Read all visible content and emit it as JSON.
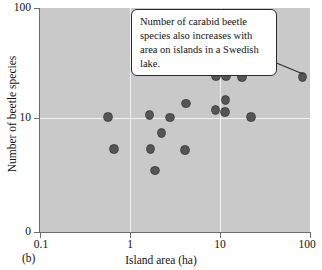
{
  "figure": {
    "panel_label": "(b)",
    "annotation": "Number of carabid beetle species also increases with area on islands in a Swedish lake."
  },
  "chart_data": {
    "type": "scatter",
    "title": "",
    "subtitle": "",
    "xlabel": "Island area (ha)",
    "ylabel": "Number of beetle species",
    "xscale": "log",
    "yscale": "log",
    "xlim": [
      0.1,
      100
    ],
    "ylim": [
      0,
      100
    ],
    "xticks": [
      0.1,
      1,
      10,
      100
    ],
    "xtick_labels": [
      "0.1",
      "1",
      "10",
      "100"
    ],
    "yticks": [
      0,
      10,
      100
    ],
    "ytick_labels": [
      "0",
      "10",
      "100"
    ],
    "grid": true,
    "grid_color": "#f0f0f0",
    "plot_background": "#c9c9c9",
    "marker_color": "#555556",
    "marker_edge_color": "#2d2d2e",
    "legend": null,
    "annotations": [
      {
        "text": "Number of carabid beetle species also increases with area on islands in a Swedish lake.",
        "points_to": [
          83,
          23.6
        ]
      }
    ],
    "points": [
      {
        "x": 0.57,
        "y": 10.2
      },
      {
        "x": 0.66,
        "y": 7.3
      },
      {
        "x": 1.65,
        "y": 10.7
      },
      {
        "x": 1.7,
        "y": 7.3
      },
      {
        "x": 1.9,
        "y": 5.4
      },
      {
        "x": 2.25,
        "y": 8.7
      },
      {
        "x": 2.8,
        "y": 10.1
      },
      {
        "x": 4.1,
        "y": 7.2
      },
      {
        "x": 4.2,
        "y": 13.5
      },
      {
        "x": 8.9,
        "y": 11.8
      },
      {
        "x": 9.0,
        "y": 24.0
      },
      {
        "x": 11.4,
        "y": 11.3
      },
      {
        "x": 11.5,
        "y": 14.5
      },
      {
        "x": 11.6,
        "y": 24.0
      },
      {
        "x": 17.5,
        "y": 23.5
      },
      {
        "x": 22.0,
        "y": 10.2
      },
      {
        "x": 83.0,
        "y": 23.6
      }
    ]
  }
}
